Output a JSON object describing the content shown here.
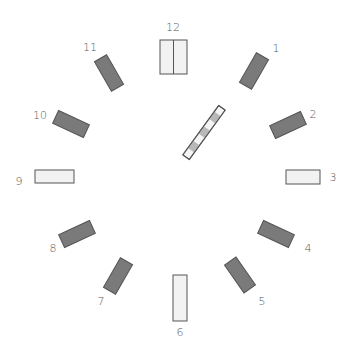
{
  "diagram": {
    "type": "clock-face-stimulus",
    "colors": {
      "dark_fill": "#7a7a7a",
      "light_fill": "#f2f2f2",
      "stroke": "#555555",
      "label": "#555555",
      "stripe_gray": "#b0b0b0"
    },
    "labels": [
      "12",
      "1",
      "2",
      "3",
      "4",
      "5",
      "6",
      "7",
      "8",
      "9",
      "10",
      "11"
    ],
    "center_bar": {
      "style": "striped",
      "orientation": "diagonal"
    }
  }
}
